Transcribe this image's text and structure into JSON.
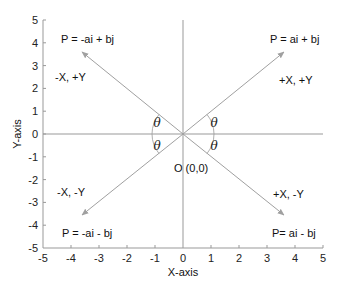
{
  "diagram": {
    "x_axis_label": "X-axis",
    "y_axis_label": "Y-axis",
    "x_ticks": [
      "-5",
      "-4",
      "-3",
      "-2",
      "-1",
      "0",
      "1",
      "2",
      "3",
      "4",
      "5"
    ],
    "y_ticks": [
      "5",
      "4",
      "3",
      "2",
      "1",
      "0",
      "-1",
      "-2",
      "-3",
      "-4",
      "-5"
    ],
    "origin_label": "O (0,0)",
    "angle_symbol": "θ",
    "quadrants": {
      "q1": {
        "vector": "P = ai + bj",
        "signs": "+X, +Y"
      },
      "q2": {
        "vector": "P = -ai + bj",
        "signs": "-X, +Y"
      },
      "q3": {
        "vector": "P = -ai - bj",
        "signs": "-X, -Y"
      },
      "q4": {
        "vector": "P= ai - bj",
        "signs": "+X, -Y"
      }
    },
    "colors": {
      "axis": "#999999",
      "vector": "#a0a0a0",
      "text": "#111111"
    }
  }
}
